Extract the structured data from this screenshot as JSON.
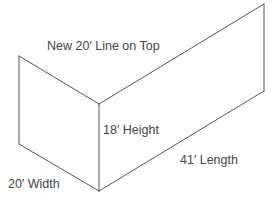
{
  "diagram": {
    "title": "",
    "colors": {
      "background": "#ffffff",
      "edges": "#555555",
      "text": "#444444"
    },
    "shape": "L-shaped pair of vertical wall panels (isometric)",
    "labels": {
      "top_line": "New 20′ Line on Top",
      "height": "18′ Height",
      "length": "41′ Length",
      "width": "20′ Width"
    },
    "dimensions": {
      "top_line_ft": 20,
      "height_ft": 18,
      "length_ft": 41,
      "width_ft": 20
    }
  }
}
